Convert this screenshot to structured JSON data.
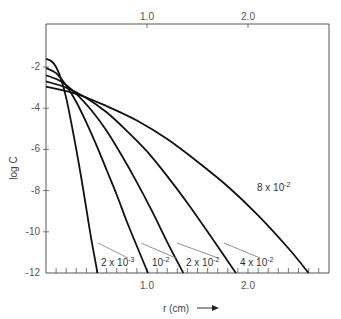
{
  "chart_data": {
    "type": "line",
    "title": "",
    "xlabel": "r (cm)",
    "xlabel_arrow": "→",
    "ylabel": "log C",
    "xlim": [
      0,
      2.8
    ],
    "ylim": [
      -12,
      -0.2
    ],
    "grid": false,
    "legend_position": "inline-labels",
    "x_ticks_top": [
      "1.0",
      "2.0"
    ],
    "x_ticks_bottom": [
      "1.0",
      "2.0"
    ],
    "y_ticks": [
      "-2",
      "-4",
      "-6",
      "-8",
      "-10",
      "-12"
    ],
    "series": [
      {
        "name": "2 x 10^-3",
        "label_main": "2 x 10",
        "label_exp": "-3",
        "r_end": 0.51,
        "start": -1.6,
        "x": [
          0,
          0.05,
          0.1,
          0.15,
          0.2,
          0.25,
          0.3,
          0.35,
          0.4,
          0.45,
          0.51
        ],
        "y": [
          -1.6,
          -1.7,
          -2.0,
          -2.6,
          -3.5,
          -4.7,
          -6.0,
          -7.4,
          -8.9,
          -10.4,
          -12.0
        ]
      },
      {
        "name": "10^-2",
        "label_main": "10",
        "label_exp": "-2",
        "r_end": 1.01,
        "start": -2.05,
        "x": [
          0,
          0.1,
          0.2,
          0.3,
          0.4,
          0.5,
          0.6,
          0.7,
          0.8,
          0.9,
          1.01
        ],
        "y": [
          -2.05,
          -2.3,
          -2.9,
          -3.7,
          -4.7,
          -5.8,
          -7.0,
          -8.2,
          -9.5,
          -10.7,
          -12.0
        ]
      },
      {
        "name": "2 x 10^-2",
        "label_main": "2 x 10",
        "label_exp": "-2",
        "r_end": 1.36,
        "start": -2.4,
        "x": [
          0,
          0.15,
          0.3,
          0.45,
          0.6,
          0.75,
          0.9,
          1.05,
          1.2,
          1.36
        ],
        "y": [
          -2.4,
          -2.7,
          -3.3,
          -4.1,
          -5.1,
          -6.3,
          -7.6,
          -9.0,
          -10.5,
          -12.0
        ]
      },
      {
        "name": "4 x 10^-2",
        "label_main": "4 x 10",
        "label_exp": "-2",
        "r_end": 1.88,
        "start": -2.7,
        "x": [
          0,
          0.2,
          0.4,
          0.6,
          0.8,
          1.0,
          1.2,
          1.4,
          1.6,
          1.88
        ],
        "y": [
          -2.7,
          -3.0,
          -3.5,
          -4.2,
          -5.1,
          -6.1,
          -7.3,
          -8.6,
          -10.0,
          -12.0
        ]
      },
      {
        "name": "8 x 10^-2",
        "label_main": "8 x 10",
        "label_exp": "-2",
        "r_end": 2.6,
        "start": -2.95,
        "x": [
          0,
          0.3,
          0.6,
          0.9,
          1.2,
          1.5,
          1.8,
          2.1,
          2.4,
          2.6
        ],
        "y": [
          -2.95,
          -3.3,
          -3.9,
          -4.6,
          -5.5,
          -6.6,
          -7.8,
          -9.2,
          -10.8,
          -12.0
        ]
      }
    ]
  }
}
